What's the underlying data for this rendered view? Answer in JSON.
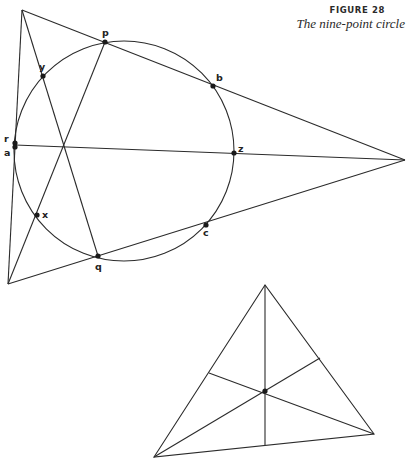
{
  "caption": {
    "figure_number": "FIGURE 28",
    "title": "The nine-point circle"
  },
  "main_diagram": {
    "triangle_vertices": {
      "top": [
        22,
        10
      ],
      "left": [
        8,
        284
      ],
      "right": [
        405,
        160
      ]
    },
    "orthocenter": [
      64,
      145
    ],
    "circle": {
      "cx": 124,
      "cy": 151,
      "r": 110
    },
    "points": [
      {
        "label": "p",
        "x": 105,
        "y": 42,
        "lx": 102,
        "ly": 36
      },
      {
        "label": "y",
        "x": 43,
        "y": 76,
        "lx": 39,
        "ly": 70
      },
      {
        "label": "b",
        "x": 213,
        "y": 86,
        "lx": 216,
        "ly": 81
      },
      {
        "label": "r",
        "x": 15,
        "y": 143,
        "lx": 4,
        "ly": 142
      },
      {
        "label": "a",
        "x": 15,
        "y": 147,
        "lx": 4,
        "ly": 156
      },
      {
        "label": "z",
        "x": 234,
        "y": 153,
        "lx": 238,
        "ly": 152
      },
      {
        "label": "x",
        "x": 37,
        "y": 215,
        "lx": 42,
        "ly": 218
      },
      {
        "label": "c",
        "x": 206,
        "y": 225,
        "lx": 203,
        "ly": 236
      },
      {
        "label": "q",
        "x": 98,
        "y": 256,
        "lx": 95,
        "ly": 270
      }
    ]
  },
  "small_triangle": {
    "vertices": {
      "top": [
        265,
        285
      ],
      "left": [
        154,
        457
      ],
      "right": [
        374,
        434
      ]
    },
    "center": [
      265,
      391
    ],
    "feet": {
      "left_side": [
        209,
        373
      ],
      "right_side": [
        320,
        358
      ],
      "bottom": [
        265,
        445
      ]
    }
  }
}
